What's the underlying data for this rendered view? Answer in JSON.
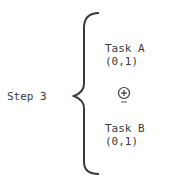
{
  "diagram": {
    "step_label": "Step 3",
    "branches": [
      {
        "task": "Task A",
        "range": "(0,1)"
      },
      {
        "task": "Task B",
        "range": "(0,1)"
      }
    ],
    "operator": {
      "symbol": "+",
      "icon": "circled-plus-underlined-icon"
    },
    "colors": {
      "ink": "#3a3a3a",
      "background": "#ffffff"
    }
  }
}
